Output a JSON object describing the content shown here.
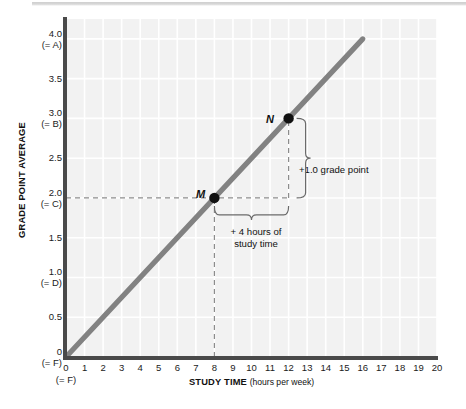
{
  "chart_data": {
    "type": "line",
    "title": "",
    "xlabel": "STUDY TIME",
    "xlabel_unit": "(hours per week)",
    "ylabel": "GRADE POINT AVERAGE",
    "xlim": [
      0,
      20
    ],
    "ylim": [
      0,
      4.25
    ],
    "grid": true,
    "legend": "none",
    "x_ticks": [
      {
        "value": 0,
        "label": "0",
        "grade": "(= F)"
      },
      {
        "value": 1,
        "label": "1",
        "grade": ""
      },
      {
        "value": 2,
        "label": "2",
        "grade": ""
      },
      {
        "value": 3,
        "label": "3",
        "grade": ""
      },
      {
        "value": 4,
        "label": "4",
        "grade": ""
      },
      {
        "value": 5,
        "label": "5",
        "grade": ""
      },
      {
        "value": 6,
        "label": "6",
        "grade": ""
      },
      {
        "value": 7,
        "label": "7",
        "grade": ""
      },
      {
        "value": 8,
        "label": "8",
        "grade": ""
      },
      {
        "value": 9,
        "label": "9",
        "grade": ""
      },
      {
        "value": 10,
        "label": "10",
        "grade": ""
      },
      {
        "value": 11,
        "label": "11",
        "grade": ""
      },
      {
        "value": 12,
        "label": "12",
        "grade": ""
      },
      {
        "value": 13,
        "label": "13",
        "grade": ""
      },
      {
        "value": 14,
        "label": "14",
        "grade": ""
      },
      {
        "value": 15,
        "label": "15",
        "grade": ""
      },
      {
        "value": 16,
        "label": "16",
        "grade": ""
      },
      {
        "value": 17,
        "label": "17",
        "grade": ""
      },
      {
        "value": 18,
        "label": "18",
        "grade": ""
      },
      {
        "value": 19,
        "label": "19",
        "grade": ""
      },
      {
        "value": 20,
        "label": "20",
        "grade": ""
      }
    ],
    "y_ticks": [
      {
        "value": 4.0,
        "label": "4.0",
        "grade": "(= A)"
      },
      {
        "value": 3.5,
        "label": "3.5",
        "grade": ""
      },
      {
        "value": 3.0,
        "label": "3.0",
        "grade": "(= B)"
      },
      {
        "value": 2.5,
        "label": "2.5",
        "grade": ""
      },
      {
        "value": 2.0,
        "label": "2.0",
        "grade": "(= C)"
      },
      {
        "value": 1.5,
        "label": "1.5",
        "grade": ""
      },
      {
        "value": 1.0,
        "label": "1.0",
        "grade": "(= D)"
      },
      {
        "value": 0.5,
        "label": "0.5",
        "grade": ""
      },
      {
        "value": 0,
        "label": "0",
        "grade": "(= F)"
      }
    ],
    "series": [
      {
        "name": "study time vs GPA",
        "slope": 0.25,
        "intercept": 0,
        "x": [
          0,
          16
        ],
        "values": [
          0,
          4.0
        ],
        "color": "#828282"
      }
    ],
    "points": [
      {
        "name": "M",
        "label": "M",
        "x": 8,
        "y": 2.0
      },
      {
        "name": "N",
        "label": "N",
        "x": 12,
        "y": 3.0
      }
    ],
    "annotations": {
      "vertical_brace_label": "+1.0 grade point",
      "horizontal_brace_line1": "+ 4 hours of",
      "horizontal_brace_line2": "study time"
    }
  },
  "colors": {
    "plot_background": "#f2f2f2",
    "gridline": "#ffffff",
    "axis": "#4a4a4a",
    "line": "#828282",
    "point": "#111111",
    "guide_dash": "#8c8c8c",
    "text": "#111111"
  }
}
